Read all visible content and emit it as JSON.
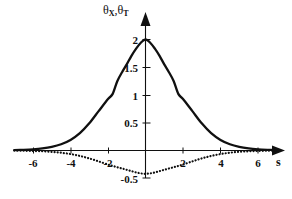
{
  "chart_data": {
    "type": "line",
    "title": "",
    "subtitle": "",
    "xlabel": "s",
    "ylabel": "θ X , θ T",
    "ylabel_parts": {
      "theta1": "θ",
      "sub1": "X",
      "comma": ",",
      "theta2": "θ",
      "sub2": "T"
    },
    "xlim": [
      -7.2,
      7.0
    ],
    "ylim": [
      -0.62,
      2.2
    ],
    "grid": false,
    "legend": "none",
    "xticks": [
      -6,
      -4,
      -2,
      2,
      4,
      6
    ],
    "xtick_labels": [
      "-6",
      "-4",
      "-2",
      "2",
      "4",
      "6"
    ],
    "yticks": [
      0.5,
      1,
      1.5,
      2,
      -0.5
    ],
    "ytick_labels": [
      "0.5",
      "1",
      "1.5",
      "2",
      "-0.5"
    ],
    "series": [
      {
        "name": "theta_X",
        "style": "solid",
        "color": "#101010",
        "peak": 2.0,
        "peak_x": 0,
        "x": [
          -7.0,
          -6.5,
          -6.0,
          -5.5,
          -5.0,
          -4.5,
          -4.0,
          -3.5,
          -3.0,
          -2.5,
          -2.0,
          -1.75,
          -1.5,
          -1.25,
          -1.0,
          -0.75,
          -0.5,
          -0.25,
          0,
          0.25,
          0.5,
          0.75,
          1.0,
          1.25,
          1.5,
          1.75,
          2.0,
          2.5,
          3.0,
          3.5,
          4.0,
          4.5,
          5.0,
          5.5,
          6.0,
          6.5,
          7.0
        ],
        "values": [
          0.006,
          0.012,
          0.021,
          0.037,
          0.065,
          0.112,
          0.19,
          0.312,
          0.489,
          0.709,
          0.927,
          1.02,
          1.253,
          1.41,
          1.552,
          1.706,
          1.836,
          1.942,
          2.0,
          1.942,
          1.836,
          1.706,
          1.552,
          1.41,
          1.253,
          1.02,
          0.927,
          0.709,
          0.489,
          0.312,
          0.19,
          0.112,
          0.065,
          0.037,
          0.021,
          0.012,
          0.006
        ]
      },
      {
        "name": "theta_T",
        "style": "dotted",
        "color": "#101010",
        "minimum": -0.42,
        "minimum_x": 0,
        "x": [
          -7.0,
          -6.5,
          -6.0,
          -5.5,
          -5.0,
          -4.5,
          -4.0,
          -3.5,
          -3.0,
          -2.5,
          -2.0,
          -1.75,
          -1.5,
          -1.25,
          -1.0,
          -0.75,
          -0.5,
          -0.25,
          0,
          0.25,
          0.5,
          0.75,
          1.0,
          1.25,
          1.5,
          1.75,
          2.0,
          2.5,
          3.0,
          3.5,
          4.0,
          4.5,
          5.0,
          5.5,
          6.0,
          6.5,
          7.0
        ],
        "values": [
          -0.002,
          -0.004,
          -0.008,
          -0.014,
          -0.024,
          -0.04,
          -0.064,
          -0.098,
          -0.143,
          -0.196,
          -0.252,
          -0.278,
          -0.302,
          -0.324,
          -0.348,
          -0.372,
          -0.395,
          -0.412,
          -0.42,
          -0.412,
          -0.395,
          -0.372,
          -0.348,
          -0.324,
          -0.302,
          -0.278,
          -0.252,
          -0.196,
          -0.143,
          -0.098,
          -0.064,
          -0.04,
          -0.024,
          -0.014,
          -0.008,
          -0.004,
          -0.002
        ]
      }
    ]
  },
  "axes": {
    "x_axis_name": "horizontal-axis",
    "y_axis_name": "vertical-axis",
    "x_arrow": true,
    "y_arrow": true
  },
  "colors": {
    "ink": "#101010",
    "background": "#ffffff"
  }
}
